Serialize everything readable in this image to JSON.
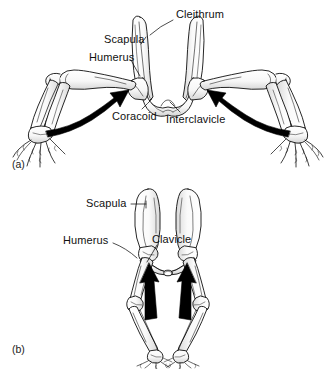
{
  "figure": {
    "background_color": "#ffffff",
    "ink_color": "#000000",
    "arrow_color": "#000000",
    "bone_fill": "#fdfdfd",
    "bone_shade": "#d9d9d9"
  },
  "panels": [
    {
      "id": "a",
      "id_label": "(a)",
      "description": "Sprawling tetrapod pectoral girdle, anterior view",
      "labels": [
        {
          "key": "cleithrum",
          "text": "Cleithrum"
        },
        {
          "key": "scapula",
          "text": "Scapula"
        },
        {
          "key": "humerus",
          "text": "Humerus"
        },
        {
          "key": "coracoid",
          "text": "Coracoid"
        },
        {
          "key": "interclavicle",
          "text": "Interclavicle"
        }
      ],
      "arrows": [
        {
          "key": "left-curved-arrow",
          "direction": "up-right",
          "style": "curved-thick"
        },
        {
          "key": "right-curved-arrow",
          "direction": "up-left",
          "style": "curved-thick"
        }
      ]
    },
    {
      "id": "b",
      "id_label": "(b)",
      "description": "Erect mammalian pectoral girdle, anterior view",
      "labels": [
        {
          "key": "scapula",
          "text": "Scapula"
        },
        {
          "key": "humerus",
          "text": "Humerus"
        },
        {
          "key": "clavicle",
          "text": "Clavicle"
        }
      ],
      "arrows": [
        {
          "key": "left-straight-arrow",
          "direction": "up",
          "style": "straight-thick"
        },
        {
          "key": "right-straight-arrow",
          "direction": "up",
          "style": "straight-thick"
        }
      ]
    }
  ]
}
